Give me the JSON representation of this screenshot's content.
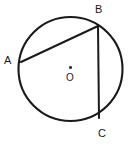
{
  "figure": {
    "background_color": "#ffffff",
    "stroke_color": "#1a1a1a",
    "width": 137,
    "height": 150
  },
  "circle": {
    "name": "circle-outline",
    "center_x": 70.5,
    "center_y": 69,
    "radius": 52,
    "stroke_width": 2.1
  },
  "center_marker": {
    "name": "center-point-O",
    "x": 70.5,
    "y": 67.5,
    "size": 2.6,
    "label": "O"
  },
  "points": [
    {
      "id": "A",
      "label": "A",
      "x": 21,
      "y": 62,
      "label_x": 4,
      "label_y": 55
    },
    {
      "id": "B",
      "label": "B",
      "x": 98,
      "y": 26,
      "label_x": 95,
      "label_y": 4
    },
    {
      "id": "C",
      "label": "C",
      "x": 99,
      "y": 118,
      "label_x": 98,
      "label_y": 128
    }
  ],
  "segments": [
    {
      "name": "chord-AB",
      "from": "A",
      "to": "B",
      "x1": 21,
      "y1": 62,
      "x2": 98,
      "y2": 26,
      "stroke_width": 2.0
    },
    {
      "name": "chord-BC",
      "from": "B",
      "to": "C",
      "x1": 98,
      "y1": 26,
      "x2": 99,
      "y2": 118,
      "stroke_width": 2.0
    }
  ]
}
